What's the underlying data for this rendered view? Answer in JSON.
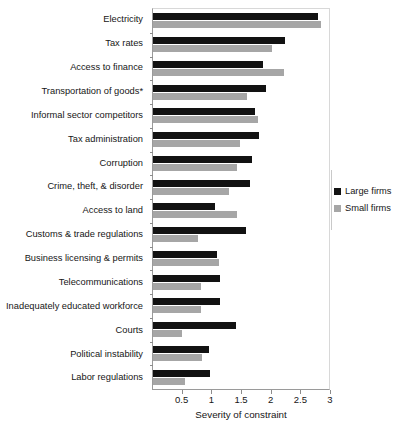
{
  "chart_data": {
    "type": "bar",
    "orientation": "horizontal",
    "title": "",
    "xlabel": "Severity of constraint",
    "ylabel": "",
    "xlim": [
      0.0,
      3.0
    ],
    "xticks": [
      0.5,
      1,
      1.5,
      2,
      2.5,
      3
    ],
    "xtick_labels": [
      "0.5",
      "1",
      "1.5",
      "2",
      "2.5",
      "3"
    ],
    "grid": false,
    "legend_position": "right",
    "categories": [
      "Electricity",
      "Tax rates",
      "Access to finance",
      "Transportation of goods*",
      "Informal sector competitors",
      "Tax administration",
      "Corruption",
      "Crime, theft, & disorder",
      "Access to land",
      "Customs & trade regulations",
      "Business licensing & permits",
      "Telecommunications",
      "Inadequately educated workforce",
      "Courts",
      "Political instability",
      "Labor regulations"
    ],
    "series": [
      {
        "name": "Large firms",
        "color": "#121212",
        "values": [
          2.82,
          2.25,
          1.88,
          1.93,
          1.74,
          1.81,
          1.69,
          1.66,
          1.06,
          1.58,
          1.09,
          1.14,
          1.14,
          1.41,
          0.96,
          0.97
        ]
      },
      {
        "name": "Small firms",
        "color": "#a6a6a6",
        "values": [
          2.87,
          2.02,
          2.23,
          1.61,
          1.79,
          1.48,
          1.44,
          1.29,
          1.44,
          0.76,
          1.12,
          0.82,
          0.81,
          0.49,
          0.84,
          0.54
        ]
      }
    ],
    "footnote_marker": "*"
  }
}
